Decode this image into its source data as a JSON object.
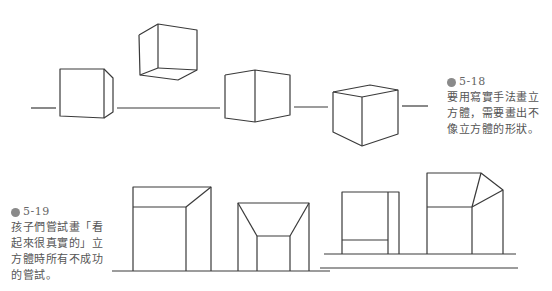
{
  "captions": {
    "fig_5_18": {
      "number": "5-18",
      "text": "要用寫實手法畫立\n方體，需要畫出不\n像立方體的形狀。"
    },
    "fig_5_19": {
      "number": "5-19",
      "text": "孩子們嘗試畫「看\n起來很真實的」立\n方體時所有不成功\n的嘗試。"
    }
  },
  "icons": {
    "figure_badge": "figure-number-badge"
  },
  "colors": {
    "line": "#3a3a3a",
    "text": "#555555",
    "badge": "#8a8a8a",
    "background": "#ffffff"
  }
}
